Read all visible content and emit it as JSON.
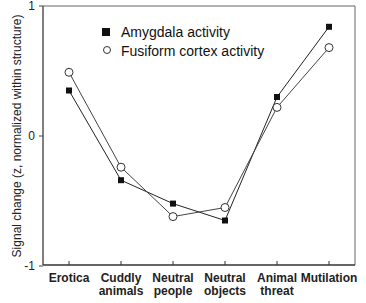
{
  "chart_data": {
    "type": "line",
    "title": "",
    "xlabel": "",
    "ylabel": "Signal change (z, normalized within structure)",
    "ylim": [
      -1,
      1
    ],
    "yticks": [
      "1",
      "0",
      "-1"
    ],
    "grid": false,
    "legend_position": "upper-center",
    "categories": [
      [
        "Erotica"
      ],
      [
        "Cuddly",
        "animals"
      ],
      [
        "Neutral",
        "people"
      ],
      [
        "Neutral",
        "objects"
      ],
      [
        "Animal",
        "threat"
      ],
      [
        "Mutilation"
      ]
    ],
    "category_names": [
      "Erotica",
      "Cuddly animals",
      "Neutral people",
      "Neutral objects",
      "Animal threat",
      "Mutilation"
    ],
    "series": [
      {
        "name": "Amygdala activity",
        "marker": "filled-square",
        "color": "#111111",
        "values": [
          0.35,
          -0.34,
          -0.52,
          -0.65,
          0.3,
          0.84
        ]
      },
      {
        "name": "Fusiform cortex activity",
        "marker": "open-circle",
        "color": "#333333",
        "values": [
          0.49,
          -0.24,
          -0.62,
          -0.55,
          0.22,
          0.68
        ]
      }
    ]
  }
}
